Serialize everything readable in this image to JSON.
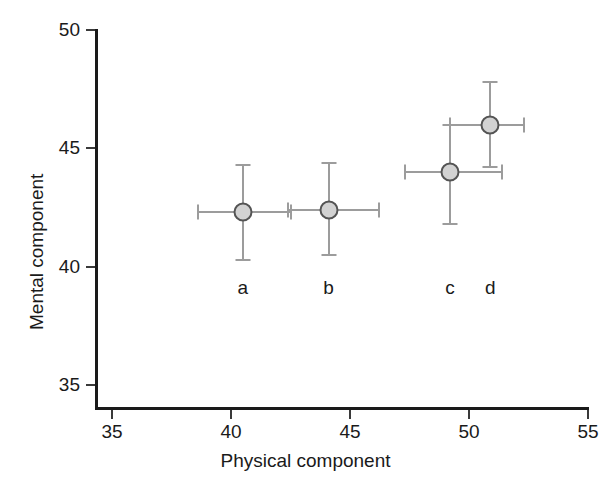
{
  "chart_data": {
    "type": "scatter",
    "title": "",
    "xlabel": "Physical component",
    "ylabel": "Mental component",
    "xlim": [
      35,
      55
    ],
    "ylim": [
      33.5,
      50.6
    ],
    "xticks": [
      35,
      40,
      45,
      50,
      55
    ],
    "yticks": [
      35,
      40,
      45,
      50
    ],
    "xtick_labels": [
      "35",
      "40",
      "45",
      "50",
      "55"
    ],
    "ytick_labels": [
      "35",
      "40",
      "45",
      "50"
    ],
    "grid": false,
    "legend": "none",
    "marker_fill": "#d2d2d2",
    "marker_edge": "#545454",
    "errorbar_color": "#9c9c9c",
    "axis_color": "#1a1a1a",
    "points": [
      {
        "label": "a",
        "x": 40.5,
        "y": 42.3,
        "x_err_low": 38.6,
        "x_err_high": 42.5,
        "y_err_low": 40.3,
        "y_err_high": 44.3
      },
      {
        "label": "b",
        "x": 44.1,
        "y": 42.4,
        "x_err_low": 42.4,
        "x_err_high": 46.2,
        "y_err_low": 40.5,
        "y_err_high": 44.4
      },
      {
        "label": "c",
        "x": 49.2,
        "y": 44.0,
        "x_err_low": 47.3,
        "x_err_high": 51.4,
        "y_err_low": 41.8,
        "y_err_high": 46.0
      },
      {
        "label": "d",
        "x": 50.9,
        "y": 46.0,
        "x_err_low": 49.2,
        "x_err_high": 52.3,
        "y_err_low": 44.2,
        "y_err_high": 47.8
      }
    ]
  }
}
